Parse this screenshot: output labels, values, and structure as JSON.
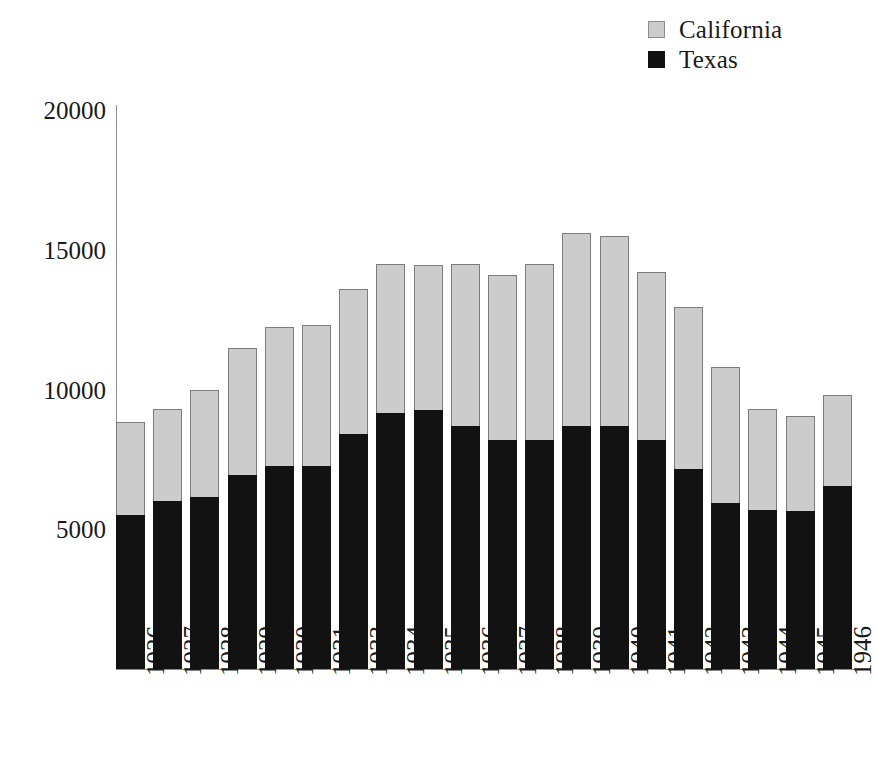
{
  "chart_data": {
    "type": "bar",
    "subtype": "stacked-vertical",
    "title": "",
    "xlabel": "",
    "ylabel": "",
    "ylim": [
      0,
      20000
    ],
    "yticks": [
      5000,
      10000,
      15000,
      20000
    ],
    "ytick_labels": [
      "5000",
      "10000",
      "15000",
      "20000"
    ],
    "grid": false,
    "legend_position": "top-right",
    "categories": [
      "1926",
      "1927",
      "1928",
      "1929",
      "1930",
      "1931",
      "1933",
      "1934",
      "1935",
      "1936",
      "1937",
      "1938",
      "1939",
      "1940",
      "1941",
      "1942",
      "1943",
      "1944",
      "1945",
      "1946"
    ],
    "series": [
      {
        "name": "Texas",
        "color": "#121212",
        "values": [
          5500,
          6000,
          6150,
          6950,
          7250,
          7250,
          8400,
          9150,
          9250,
          8700,
          8200,
          8200,
          8700,
          8700,
          8200,
          7150,
          5950,
          5700,
          5650,
          6550
        ]
      },
      {
        "name": "California",
        "color": "#cccccc",
        "values": [
          3350,
          3300,
          3850,
          4550,
          5000,
          5050,
          5200,
          5350,
          5200,
          5800,
          5900,
          6300,
          6900,
          6800,
          6000,
          5800,
          4850,
          3600,
          3400,
          3250
        ]
      }
    ],
    "totals": [
      8850,
      9300,
      10000,
      11500,
      12250,
      12300,
      13600,
      14500,
      14450,
      14500,
      14100,
      14500,
      15600,
      15500,
      14200,
      12950,
      10800,
      9300,
      9050,
      9800
    ]
  },
  "legend": {
    "items": [
      {
        "label": "California",
        "swatch": "california-swatch",
        "color": "#cccccc"
      },
      {
        "label": "Texas",
        "swatch": "texas-swatch",
        "color": "#121212"
      }
    ]
  }
}
